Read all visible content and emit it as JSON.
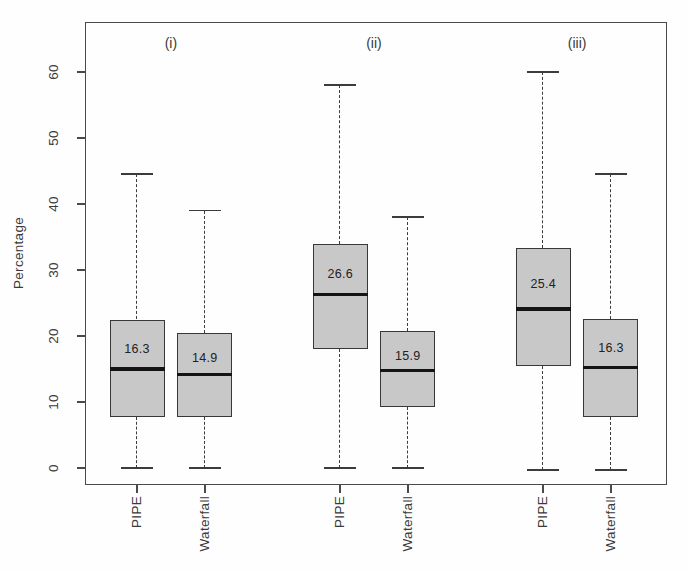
{
  "figure": {
    "ylabel": "Percentage",
    "group_labels": [
      "(i)",
      "(ii)",
      "(iii)"
    ],
    "x_tick_labels": [
      "PIPE",
      "Waterfall",
      "PIPE",
      "Waterfall",
      "PIPE",
      "Waterfall"
    ],
    "y_tick_labels": [
      "0",
      "10",
      "20",
      "30",
      "40",
      "50",
      "60"
    ]
  },
  "colors": {
    "box_fill": "#c8c8c8",
    "box_border": "#383838",
    "median_line": "#141414",
    "whisker": "#3c3c3c",
    "axis": "#4a4a4a",
    "text": "#3a3a3a"
  },
  "chart_data": {
    "type": "boxplot",
    "title": "",
    "xlabel": "",
    "ylabel": "Percentage",
    "ylim": [
      -2.5,
      67.5
    ],
    "y_ticks": [
      0,
      10,
      20,
      30,
      40,
      50,
      60
    ],
    "grid": false,
    "legend_position": "none",
    "groups": [
      {
        "label": "(i)",
        "boxes": [
          {
            "category": "PIPE",
            "whisker_low": 0,
            "q1": 7.8,
            "median": 15.0,
            "q3": 22.5,
            "whisker_high": 44.5,
            "mean_label": "16.3"
          },
          {
            "category": "Waterfall",
            "whisker_low": 0,
            "q1": 7.7,
            "median": 14.2,
            "q3": 20.5,
            "whisker_high": 39.0,
            "mean_label": "14.9"
          }
        ]
      },
      {
        "label": "(ii)",
        "boxes": [
          {
            "category": "PIPE",
            "whisker_low": 0,
            "q1": 18.0,
            "median": 26.3,
            "q3": 34.0,
            "whisker_high": 58.0,
            "mean_label": "26.6"
          },
          {
            "category": "Waterfall",
            "whisker_low": 0,
            "q1": 9.2,
            "median": 14.8,
            "q3": 20.7,
            "whisker_high": 38.0,
            "mean_label": "15.9"
          }
        ]
      },
      {
        "label": "(iii)",
        "boxes": [
          {
            "category": "PIPE",
            "whisker_low": -0.3,
            "q1": 15.5,
            "median": 24.1,
            "q3": 33.3,
            "whisker_high": 60.0,
            "mean_label": "25.4"
          },
          {
            "category": "Waterfall",
            "whisker_low": -0.3,
            "q1": 7.8,
            "median": 15.2,
            "q3": 22.6,
            "whisker_high": 44.5,
            "mean_label": "16.3"
          }
        ]
      }
    ]
  }
}
